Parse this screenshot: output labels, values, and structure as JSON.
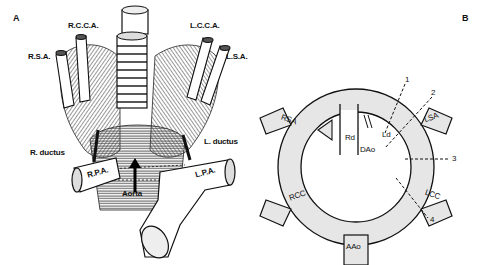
{
  "panels": {
    "a": {
      "label": "A",
      "structures": {
        "rsa": "R.S.A.",
        "rcca": "R.C.C.A.",
        "lcca": "L.C.C.A.",
        "lsa": "L.S.A.",
        "l_ductus": "L. ductus",
        "r_ductus": "R. ductus",
        "rpa": "R.P.A.",
        "lpa": "L.P.A.",
        "aorta": "Aorta",
        "signature": "Crosse"
      }
    },
    "b": {
      "label": "B",
      "vessels": {
        "rsa": "RSA",
        "lsa": "LSA",
        "rcc": "RCC",
        "lcc": "LCC",
        "aao": "AAo",
        "dao": "DAo",
        "rd": "Rd",
        "ld": "Ld"
      },
      "cut_lines": [
        "1",
        "2",
        "3",
        "4"
      ],
      "ring_fill": "#e6e6e6",
      "line_color": "#111111"
    }
  }
}
